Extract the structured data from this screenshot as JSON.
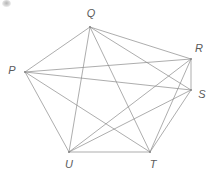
{
  "figure": {
    "name": "complete-graph-hexagon",
    "background_color": "#ffffff",
    "width": 213,
    "height": 173
  },
  "diagram": {
    "type": "graph",
    "edge_color": "#8a8a8a",
    "edge_width": 0.7,
    "label_color": "#5a5a5a",
    "vertex_count": 6,
    "edge_count": 15,
    "vertices": [
      {
        "id": "P",
        "label": "P",
        "x": 25,
        "y": 72,
        "label_x": 12,
        "label_y": 70
      },
      {
        "id": "Q",
        "label": "Q",
        "x": 90,
        "y": 27,
        "label_x": 91,
        "label_y": 13
      },
      {
        "id": "R",
        "label": "R",
        "x": 191,
        "y": 59,
        "label_x": 199,
        "label_y": 48
      },
      {
        "id": "S",
        "label": "S",
        "x": 191,
        "y": 90,
        "label_x": 202,
        "label_y": 94
      },
      {
        "id": "T",
        "label": "T",
        "x": 150,
        "y": 152,
        "label_x": 153,
        "label_y": 164
      },
      {
        "id": "U",
        "label": "U",
        "x": 69,
        "y": 152,
        "label_x": 69,
        "label_y": 164
      }
    ],
    "edges": [
      {
        "from": "P",
        "to": "Q"
      },
      {
        "from": "P",
        "to": "R"
      },
      {
        "from": "P",
        "to": "S"
      },
      {
        "from": "P",
        "to": "T"
      },
      {
        "from": "P",
        "to": "U"
      },
      {
        "from": "Q",
        "to": "R"
      },
      {
        "from": "Q",
        "to": "S"
      },
      {
        "from": "Q",
        "to": "T"
      },
      {
        "from": "Q",
        "to": "U"
      },
      {
        "from": "R",
        "to": "S"
      },
      {
        "from": "R",
        "to": "T"
      },
      {
        "from": "R",
        "to": "U"
      },
      {
        "from": "S",
        "to": "T"
      },
      {
        "from": "S",
        "to": "U"
      },
      {
        "from": "T",
        "to": "U"
      }
    ]
  },
  "artifacts": {
    "corner_smudge": {
      "name": "scan-smudge",
      "x": 2,
      "y": 0
    }
  }
}
